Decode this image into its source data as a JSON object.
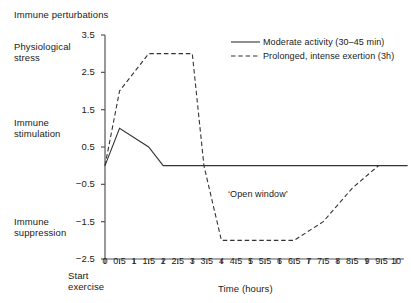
{
  "chart_data": {
    "type": "line",
    "title": "Immune perturbations",
    "xlabel": "Time (hours)",
    "ylabel": "",
    "xlim": [
      0,
      10
    ],
    "ylim": [
      -2.5,
      3.5
    ],
    "grid": false,
    "legend_position": "top-right",
    "yticks": [
      "3.5",
      "2.5",
      "1.5",
      "0.5",
      "−0.5",
      "−1.5",
      "−2.5"
    ],
    "ytick_values": [
      3.5,
      2.5,
      1.5,
      0.5,
      -0.5,
      -1.5,
      -2.5
    ],
    "xticks": [
      "0",
      "0.5",
      "1",
      "1.5",
      "2",
      "2.5",
      "3",
      "3.5",
      "4",
      "4.5",
      "5",
      "5.5",
      "6",
      "6.5",
      "7",
      "7.5",
      "8",
      "8.5",
      "9",
      "9.5",
      "10"
    ],
    "xtick_values": [
      0,
      0.5,
      1,
      1.5,
      2,
      2.5,
      3,
      3.5,
      4,
      4.5,
      5,
      5.5,
      6,
      6.5,
      7,
      7.5,
      8,
      8.5,
      9,
      9.5,
      10
    ],
    "y_axis_region_labels": [
      {
        "text": "Physiological stress",
        "approx_value": 3.0
      },
      {
        "text": "Immune stimulation",
        "approx_value": 1.0
      },
      {
        "text": "Immune suppression",
        "approx_value": -2.0
      }
    ],
    "annotations": [
      {
        "text": "‘Open window’",
        "x": 5.3,
        "y": -0.95
      },
      {
        "text": "Start exercise",
        "x": 0,
        "y": -2.5
      }
    ],
    "series": [
      {
        "name": "Moderate activity (30–45 min)",
        "style": "solid",
        "color": "#333333",
        "points": [
          {
            "x": 0.0,
            "y": 0.0
          },
          {
            "x": 0.5,
            "y": 1.0
          },
          {
            "x": 1.5,
            "y": 0.5
          },
          {
            "x": 2.0,
            "y": 0.0
          },
          {
            "x": 10.4,
            "y": 0.0
          }
        ]
      },
      {
        "name": "Prolonged, intense exertion (3h)",
        "style": "dashed",
        "color": "#333333",
        "points": [
          {
            "x": 0.0,
            "y": 0.0
          },
          {
            "x": 0.5,
            "y": 2.0
          },
          {
            "x": 1.5,
            "y": 3.0
          },
          {
            "x": 3.0,
            "y": 3.0
          },
          {
            "x": 3.4,
            "y": 0.0
          },
          {
            "x": 4.0,
            "y": -2.0
          },
          {
            "x": 6.5,
            "y": -2.0
          },
          {
            "x": 7.5,
            "y": -1.5
          },
          {
            "x": 8.5,
            "y": -0.6
          },
          {
            "x": 9.4,
            "y": 0.0
          }
        ]
      }
    ]
  },
  "legend": {
    "items": [
      {
        "label": "Moderate activity (30–45 min)",
        "style": "solid"
      },
      {
        "label": "Prolonged, intense exertion (3h)",
        "style": "dashed"
      }
    ]
  },
  "labels": {
    "title": "Immune perturbations",
    "physiological_stress": "Physiological\nstress",
    "physiological_stress_line1": "Physiological",
    "physiological_stress_line2": "stress",
    "immune_stimulation_line1": "Immune",
    "immune_stimulation_line2": "stimulation",
    "immune_suppression_line1": "Immune",
    "immune_suppression_line2": "suppression",
    "start_exercise_line1": "Start",
    "start_exercise_line2": "exercise",
    "xaxis_title": "Time (hours)",
    "open_window": "‘Open window’"
  },
  "colors": {
    "line": "#333333",
    "axis": "#555555",
    "text": "#1a1a1a",
    "background": "#ffffff"
  }
}
